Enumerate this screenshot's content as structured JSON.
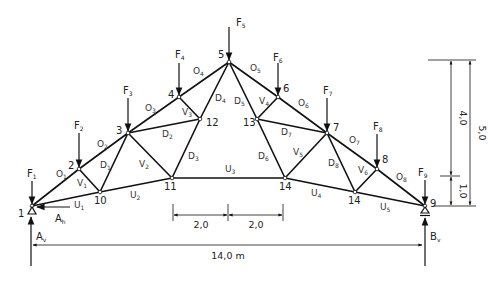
{
  "diagram": {
    "type": "truss",
    "nodes": [
      {
        "id": "1",
        "x": 32,
        "y": 206
      },
      {
        "id": "2",
        "x": 79,
        "y": 169
      },
      {
        "id": "3",
        "x": 128,
        "y": 133
      },
      {
        "id": "4",
        "x": 179,
        "y": 97
      },
      {
        "id": "5",
        "x": 229,
        "y": 62
      },
      {
        "id": "6",
        "x": 278,
        "y": 97
      },
      {
        "id": "7",
        "x": 327,
        "y": 133
      },
      {
        "id": "8",
        "x": 377,
        "y": 169
      },
      {
        "id": "9",
        "x": 425,
        "y": 206
      },
      {
        "id": "10",
        "x": 100,
        "y": 192
      },
      {
        "id": "11",
        "x": 172,
        "y": 178
      },
      {
        "id": "12",
        "x": 200,
        "y": 119
      },
      {
        "id": "13",
        "x": 257,
        "y": 119
      },
      {
        "id": "14",
        "x": 285,
        "y": 178
      },
      {
        "id": "14",
        "x": 355,
        "y": 192
      }
    ],
    "node_labels": {
      "n1": "1",
      "n2": "2",
      "n3": "3",
      "n4": "4",
      "n5": "5",
      "n6": "6",
      "n7": "7",
      "n8": "8",
      "n9": "9",
      "n10": "10",
      "n11": "11",
      "n12": "12",
      "n13": "13",
      "n14a": "14",
      "n14b": "14"
    },
    "members": {
      "O1": {
        "base": "O",
        "sub": "1"
      },
      "O2": {
        "base": "O",
        "sub": "2"
      },
      "O3": {
        "base": "O",
        "sub": "3"
      },
      "O4": {
        "base": "O",
        "sub": "4"
      },
      "O5": {
        "base": "O",
        "sub": "5"
      },
      "O6": {
        "base": "O",
        "sub": "6"
      },
      "O7": {
        "base": "O",
        "sub": "7"
      },
      "O8": {
        "base": "O",
        "sub": "8"
      },
      "U1": {
        "base": "U",
        "sub": "1"
      },
      "U2": {
        "base": "U",
        "sub": "2"
      },
      "U3": {
        "base": "U",
        "sub": "3"
      },
      "U4": {
        "base": "U",
        "sub": "4"
      },
      "U5": {
        "base": "U",
        "sub": "5"
      },
      "V1": {
        "base": "V",
        "sub": "1"
      },
      "V2": {
        "base": "V",
        "sub": "2"
      },
      "V3": {
        "base": "V",
        "sub": "3"
      },
      "V4": {
        "base": "V",
        "sub": "4"
      },
      "V5": {
        "base": "V",
        "sub": "5"
      },
      "V6": {
        "base": "V",
        "sub": "6"
      },
      "D1": {
        "base": "D",
        "sub": "1"
      },
      "D2": {
        "base": "D",
        "sub": "2"
      },
      "D3": {
        "base": "D",
        "sub": "3"
      },
      "D4": {
        "base": "D",
        "sub": "4"
      },
      "D5": {
        "base": "D",
        "sub": "5"
      },
      "D6": {
        "base": "D",
        "sub": "6"
      },
      "D7": {
        "base": "D",
        "sub": "7"
      },
      "D8": {
        "base": "D",
        "sub": "8"
      }
    },
    "loads": {
      "F1": {
        "base": "F",
        "sub": "1"
      },
      "F2": {
        "base": "F",
        "sub": "2"
      },
      "F3": {
        "base": "F",
        "sub": "3"
      },
      "F4": {
        "base": "F",
        "sub": "4"
      },
      "F5": {
        "base": "F",
        "sub": "5"
      },
      "F6": {
        "base": "F",
        "sub": "6"
      },
      "F7": {
        "base": "F",
        "sub": "7"
      },
      "F8": {
        "base": "F",
        "sub": "8"
      },
      "F9": {
        "base": "F",
        "sub": "9"
      }
    },
    "reactions": {
      "Av": {
        "base": "A",
        "sub": "v"
      },
      "Ah": {
        "base": "A",
        "sub": "h"
      },
      "Bv": {
        "base": "B",
        "sub": "v"
      }
    },
    "dimensions": {
      "span": "14,0 m",
      "seg_left": "2,0",
      "seg_right": "2,0",
      "height_upper": "4,0",
      "height_total": "5,0",
      "height_lower": "1,0"
    }
  }
}
